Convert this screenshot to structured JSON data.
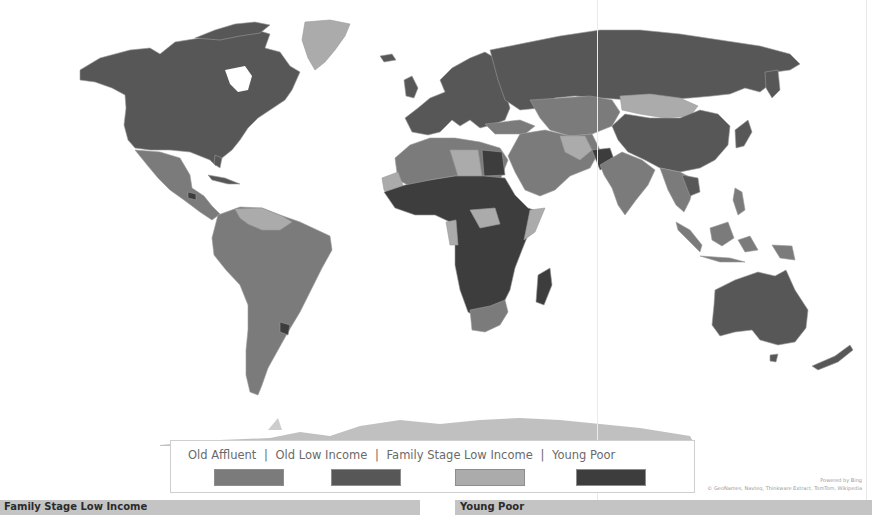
{
  "map": {
    "title": "World map by consumer segment",
    "colors": {
      "old_affluent": "#7b7b7b",
      "old_low_income": "#575757",
      "family_stage_low_income": "#ababab",
      "young_poor": "#3d3d3d",
      "ocean": "#ffffff",
      "border": "#9a9a9a"
    },
    "regions": [
      {
        "name": "North America (USA/Canada)",
        "segment": "Old Low Income"
      },
      {
        "name": "Greenland",
        "segment": "Family Stage Low Income"
      },
      {
        "name": "Mexico & Central America",
        "segment": "Old Affluent"
      },
      {
        "name": "South America",
        "segment": "Old Affluent"
      },
      {
        "name": "Guianas/Venezuela",
        "segment": "Family Stage Low Income"
      },
      {
        "name": "Uruguay",
        "segment": "Old Low Income"
      },
      {
        "name": "Europe",
        "segment": "Old Low Income"
      },
      {
        "name": "Russia",
        "segment": "Old Low Income"
      },
      {
        "name": "Central Asia",
        "segment": "Old Affluent"
      },
      {
        "name": "Mongolia",
        "segment": "Family Stage Low Income"
      },
      {
        "name": "China",
        "segment": "Old Low Income"
      },
      {
        "name": "Middle East",
        "segment": "Old Affluent"
      },
      {
        "name": "North Africa",
        "segment": "Old Affluent"
      },
      {
        "name": "Sub-Saharan Africa",
        "segment": "Young Poor"
      },
      {
        "name": "South Africa",
        "segment": "Old Affluent"
      },
      {
        "name": "India",
        "segment": "Old Affluent"
      },
      {
        "name": "Southeast Asia",
        "segment": "Old Affluent"
      },
      {
        "name": "Australia",
        "segment": "Old Low Income"
      },
      {
        "name": "New Zealand",
        "segment": "Old Low Income"
      },
      {
        "name": "Antarctica",
        "segment": "Family Stage Low Income"
      }
    ]
  },
  "legend": {
    "items": [
      {
        "label": "Old Affluent",
        "color": "#7b7b7b"
      },
      {
        "label": "Old Low Income",
        "color": "#575757"
      },
      {
        "label": "Family Stage Low Income",
        "color": "#ababab"
      },
      {
        "label": "Young Poor",
        "color": "#3d3d3d"
      }
    ],
    "separator": "|"
  },
  "attribution": {
    "powered_by": "Powered by Bing",
    "credits": "© GeoNames, Navteq, Thinkware Extract, TomTom, Wikipedia"
  },
  "bottom_panels": [
    {
      "label": "Family Stage Low Income"
    },
    {
      "label": "Young Poor"
    }
  ]
}
